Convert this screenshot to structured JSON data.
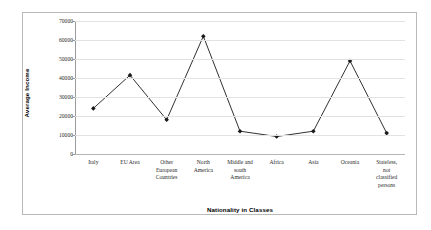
{
  "chart_data": {
    "type": "line",
    "title": "",
    "xlabel": "Nationality in Classes",
    "ylabel": "Average Income",
    "categories": [
      "Italy",
      "EU Area",
      "Other European Countries",
      "North America",
      "Middle and south America",
      "Africa",
      "Asia",
      "Oceania",
      "Stateless, not classified persons"
    ],
    "category_lines": [
      [
        "Italy"
      ],
      [
        "EU Area"
      ],
      [
        "Other",
        "European",
        "Countries"
      ],
      [
        "North",
        "America"
      ],
      [
        "Middle and",
        "south",
        "America"
      ],
      [
        "Africa"
      ],
      [
        "Asia"
      ],
      [
        "Oceania"
      ],
      [
        "Stateless,",
        "not",
        "classified",
        "persons"
      ]
    ],
    "values": [
      24000,
      41500,
      18000,
      62000,
      12000,
      9200,
      12000,
      49000,
      11000
    ],
    "ylim": [
      0,
      70000
    ],
    "yticks": [
      0,
      10000,
      20000,
      30000,
      40000,
      50000,
      60000,
      70000
    ],
    "ytick_labels": [
      "0",
      "10000",
      "20000",
      "30000",
      "40000",
      "50000",
      "60000",
      "70000"
    ],
    "grid": true,
    "legend": "none",
    "series_color": "#1a1a1a",
    "marker": "diamond",
    "gridline_color": "#e2e2e2",
    "axis_color": "#9a9a9a",
    "border_color": "#b9b9b9"
  }
}
